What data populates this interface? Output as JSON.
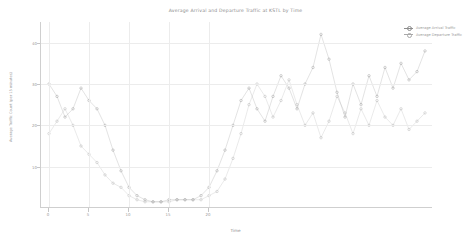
{
  "chart_data": {
    "type": "line",
    "title": "Average Arrival and Departure Traffic at KSTL by Time",
    "xlabel": "Time",
    "ylabel": "Average Traffic Count (per 15 minutes)",
    "xlim": [
      -1,
      48
    ],
    "ylim": [
      0,
      45
    ],
    "xticks": [
      0,
      5,
      10,
      15,
      20
    ],
    "yticks": [
      10,
      20,
      30,
      40
    ],
    "grid": true,
    "legend_position": "upper right",
    "markers": "circle",
    "x": [
      0,
      1,
      2,
      3,
      4,
      5,
      6,
      7,
      8,
      9,
      10,
      11,
      12,
      13,
      14,
      15,
      16,
      17,
      18,
      19,
      20,
      21,
      22,
      23,
      24,
      25,
      26,
      27,
      28,
      29,
      30,
      31,
      32,
      33,
      34,
      35,
      36,
      37,
      38,
      39,
      40,
      41,
      42,
      43,
      44,
      45,
      46,
      47
    ],
    "series": [
      {
        "name": "Average Arrival Traffic",
        "color": "#8d8d8d",
        "values": [
          30,
          27,
          22,
          24,
          29,
          26,
          24,
          20,
          14,
          9,
          5,
          3,
          2,
          1.5,
          1.5,
          2,
          2,
          2,
          2,
          3,
          5,
          9,
          14,
          20,
          26,
          29,
          24,
          21,
          27,
          32,
          29,
          24,
          30,
          34,
          42,
          36,
          28,
          22,
          30,
          25,
          32,
          27,
          34,
          29,
          35,
          31,
          33,
          38
        ]
      },
      {
        "name": "Average Departure Traffic",
        "color": "#a8a8a8",
        "values": [
          18,
          21,
          24,
          20,
          15,
          13,
          11,
          8,
          6,
          5,
          3,
          2,
          1.5,
          1.5,
          1.5,
          1.5,
          2,
          2,
          2,
          2,
          3,
          4,
          7,
          12,
          18,
          25,
          30,
          27,
          22,
          26,
          31,
          25,
          20,
          23,
          17,
          21,
          27,
          23,
          18,
          24,
          20,
          26,
          22,
          20,
          24,
          19,
          21,
          23
        ]
      }
    ]
  }
}
